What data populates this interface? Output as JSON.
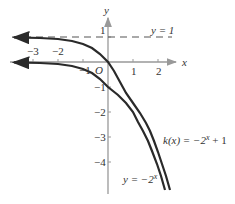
{
  "figure": {
    "axes": {
      "x_label": "x",
      "y_label": "y",
      "origin_label": "O",
      "x_ticks": [
        "−3",
        "−2",
        "−1",
        "1",
        "2"
      ],
      "y_ticks": [
        "1",
        "−1",
        "−2",
        "−3",
        "−4"
      ]
    },
    "asymptote": {
      "label": "y = 1",
      "y": 1,
      "style": "dashed"
    },
    "curves": [
      {
        "name": "k",
        "label_func": "k(x) = −2",
        "label_exp": "x",
        "label_tail": " + 1",
        "expr": "-2^x + 1"
      },
      {
        "name": "base",
        "label_func": "y = −2",
        "label_exp": "x",
        "label_tail": "",
        "expr": "-2^x"
      }
    ],
    "colors": {
      "curve": "#2a2a2a",
      "axis": "#888888",
      "text": "#333333"
    }
  }
}
